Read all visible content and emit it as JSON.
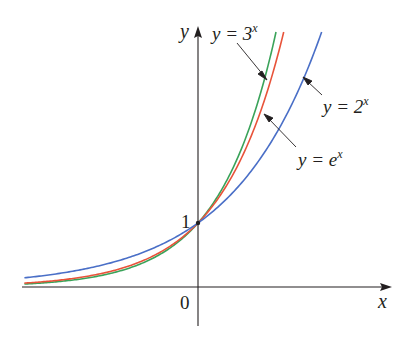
{
  "chart_data": {
    "type": "line",
    "title": "",
    "xlabel": "x",
    "ylabel": "y",
    "origin_label": "0",
    "y_tick_label": "1",
    "xlim": [
      -2.8,
      3.3
    ],
    "ylim": [
      -0.6,
      4.5
    ],
    "grid": false,
    "legend": "annotations",
    "series": [
      {
        "name": "y = 3^x",
        "base": 3,
        "color": "#3aa35a",
        "label_base": "y = 3",
        "label_exp": "x"
      },
      {
        "name": "y = e^x",
        "base": 2.718281828,
        "color": "#e8533a",
        "label_base": "y = e",
        "label_exp": "x"
      },
      {
        "name": "y = 2^x",
        "base": 2,
        "color": "#4a6fc7",
        "label_base": "y = 2",
        "label_exp": "x"
      }
    ],
    "common_point": {
      "x": 0,
      "y": 1
    }
  },
  "labels": {
    "y_axis": "y",
    "x_axis": "x",
    "origin": "0",
    "one": "1",
    "three_base": "y = 3",
    "three_exp": "x",
    "e_base": "y = e",
    "e_exp": "x",
    "two_base": "y = 2",
    "two_exp": "x"
  },
  "colors": {
    "axis": "#231f20",
    "green": "#3aa35a",
    "red": "#e8533a",
    "blue": "#4a6fc7",
    "arrow": "#231f20"
  }
}
